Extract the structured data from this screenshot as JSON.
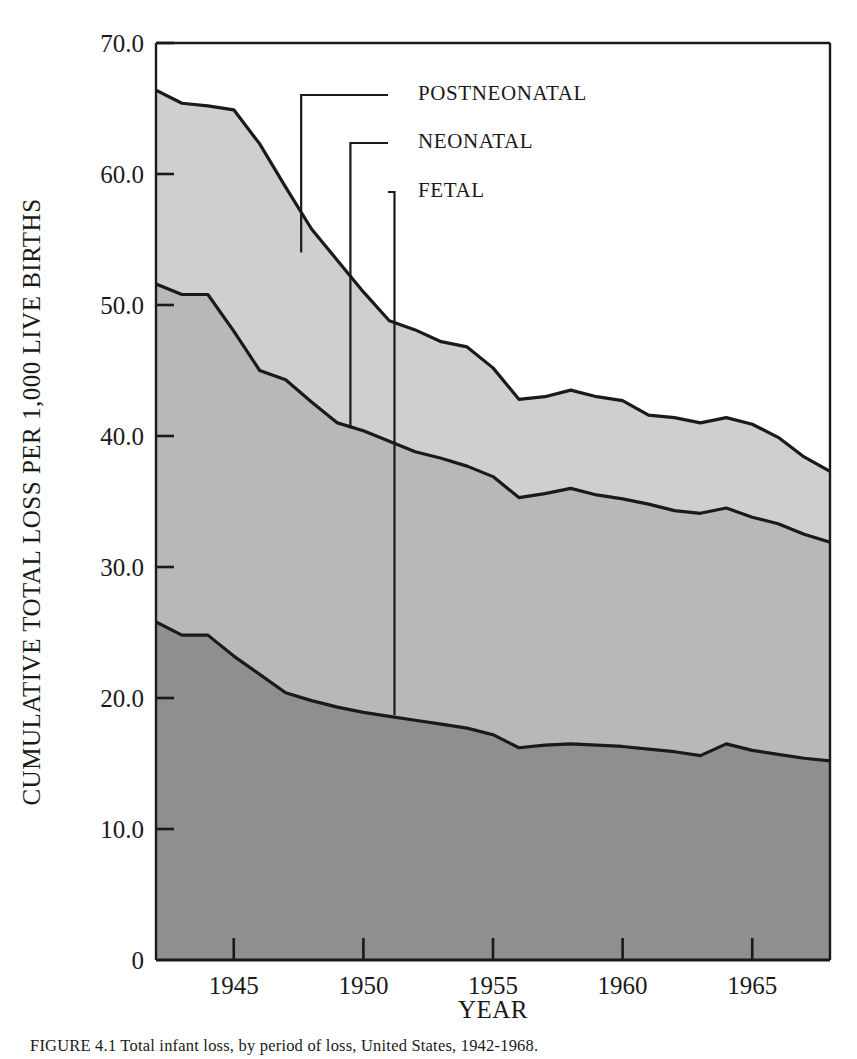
{
  "figure": {
    "caption": "FIGURE 4.1  Total infant loss, by period of loss, United States, 1942-1968."
  },
  "chart_data": {
    "type": "area",
    "stacked": true,
    "title": "",
    "xlabel": "YEAR",
    "ylabel": "CUMULATIVE TOTAL LOSS PER 1,000 LIVE BIRTHS",
    "xlim": [
      1942,
      1968
    ],
    "ylim": [
      0,
      70
    ],
    "grid": false,
    "legend_position": "inline-leader-lines",
    "x_ticks": [
      1945,
      1950,
      1955,
      1960,
      1965
    ],
    "x_tick_labels": [
      "1945",
      "1950",
      "1955",
      "1960",
      "1965"
    ],
    "y_ticks": [
      0,
      10,
      20,
      30,
      40,
      50,
      60,
      70
    ],
    "y_tick_labels": [
      "0",
      "10.0",
      "20.0",
      "30.0",
      "40.0",
      "50.0",
      "60.0",
      "70.0"
    ],
    "x": [
      1942,
      1943,
      1944,
      1945,
      1946,
      1947,
      1948,
      1949,
      1950,
      1951,
      1952,
      1953,
      1954,
      1955,
      1956,
      1957,
      1958,
      1959,
      1960,
      1961,
      1962,
      1963,
      1964,
      1965,
      1966,
      1967,
      1968
    ],
    "series": [
      {
        "name": "FETAL",
        "fill": "#8f8f8f",
        "values": [
          25.8,
          24.8,
          24.8,
          23.2,
          21.8,
          20.4,
          19.8,
          19.3,
          18.9,
          18.6,
          18.3,
          18.0,
          17.7,
          17.2,
          16.2,
          16.4,
          16.5,
          16.4,
          16.3,
          16.1,
          15.9,
          15.6,
          16.5,
          16.0,
          15.7,
          15.4,
          15.2
        ]
      },
      {
        "name": "NEONATAL",
        "fill": "#b8b8b8",
        "cumulative_values": [
          51.6,
          50.8,
          50.8,
          48.0,
          45.0,
          44.3,
          42.6,
          41.0,
          40.4,
          39.6,
          38.8,
          38.3,
          37.7,
          36.9,
          35.3,
          35.6,
          36.0,
          35.5,
          35.2,
          34.8,
          34.3,
          34.1,
          34.5,
          33.8,
          33.3,
          32.5,
          31.9
        ]
      },
      {
        "name": "POSTNEONATAL",
        "fill": "#cfcfcf",
        "cumulative_values": [
          66.4,
          65.4,
          65.2,
          64.9,
          62.3,
          59.0,
          55.8,
          53.4,
          51.0,
          48.8,
          48.1,
          47.2,
          46.8,
          45.2,
          42.8,
          43.0,
          43.5,
          43.0,
          42.7,
          41.6,
          41.4,
          41.0,
          41.4,
          40.9,
          39.9,
          38.4,
          37.3
        ]
      }
    ],
    "annotations": [
      {
        "label": "POSTNEONATAL",
        "anchor_year": 1947.6,
        "anchor_value": 54.0
      },
      {
        "label": "NEONATAL",
        "anchor_year": 1949.5,
        "anchor_value": 40.6
      },
      {
        "label": "FETAL",
        "anchor_year": 1951.2,
        "anchor_value": 18.7
      }
    ]
  },
  "colors": {
    "axis": "#1a1a1a",
    "fetal": "#8f8f8f",
    "neonatal": "#b8b8b8",
    "postneonatal": "#cfcfcf",
    "background": "#ffffff"
  }
}
